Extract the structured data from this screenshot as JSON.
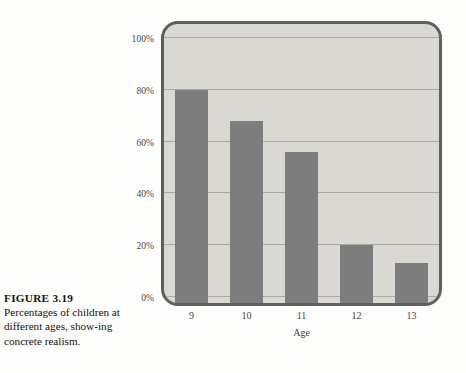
{
  "caption": {
    "label": "FIGURE 3.19",
    "text": "Percentages of children at different ages, show-ing concrete realism."
  },
  "colors": {
    "bar": "#7d7d7d",
    "panel_background": "#d9d8d2",
    "frame_border": "#5f5f5f",
    "gridline": "#a9a8a2",
    "page_background": "#fdfdfb",
    "tick_text": "#4a4a4a"
  },
  "chart_data": {
    "type": "bar",
    "title": "",
    "xlabel": "Age",
    "ylabel": "",
    "categories": [
      "9",
      "10",
      "11",
      "12",
      "13"
    ],
    "values": [
      80,
      68,
      56,
      20,
      13
    ],
    "ylim": [
      0,
      100
    ],
    "yticks": [
      0,
      20,
      40,
      60,
      80,
      100
    ],
    "ytick_labels": [
      "0%",
      "20%",
      "40%",
      "60%",
      "80%",
      "100%"
    ],
    "grid": true,
    "legend": null,
    "series": [
      {
        "name": "Percentage of children showing concrete realism",
        "values": [
          80,
          68,
          56,
          20,
          13
        ]
      }
    ]
  }
}
